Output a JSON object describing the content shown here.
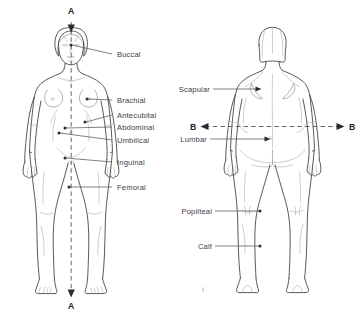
{
  "figure": {
    "background_color": "#ffffff",
    "line_color": "#3c3c42",
    "label_color": "#404048",
    "width": 361,
    "height": 315
  },
  "anterior_view": {
    "name": "anterior-figure",
    "section_axis": {
      "top_letter": "A",
      "bottom_letter": "A",
      "orientation": "vertical",
      "style": "dashed"
    },
    "labels": [
      {
        "id": "buccal",
        "text": "Buccal",
        "text_x": 117,
        "text_y": 57,
        "line_x1": 112,
        "line_y1": 54,
        "line_x2": 72,
        "line_y2": 45,
        "dot_x": 71,
        "dot_y": 45
      },
      {
        "id": "brachial",
        "text": "Brachial",
        "text_x": 117,
        "text_y": 103,
        "line_x1": 112,
        "line_y1": 100,
        "line_x2": 88,
        "line_y2": 99,
        "dot_x": 87,
        "dot_y": 99
      },
      {
        "id": "antecubital",
        "text": "Antecubital",
        "text_x": 117,
        "text_y": 118,
        "line_x1": 112,
        "line_y1": 115,
        "line_x2": 86,
        "line_y2": 122,
        "dot_x": 85,
        "dot_y": 122
      },
      {
        "id": "abdominal",
        "text": "Abdominal",
        "text_x": 117,
        "text_y": 130,
        "line_x1": 112,
        "line_y1": 127,
        "line_x2": 66,
        "line_y2": 128,
        "dot_x": 65,
        "dot_y": 128
      },
      {
        "id": "umbilical",
        "text": "Umbilical",
        "text_x": 117,
        "text_y": 143,
        "line_x1": 112,
        "line_y1": 140,
        "line_x2": 60,
        "line_y2": 133,
        "dot_x": 59,
        "dot_y": 133
      },
      {
        "id": "inguinal",
        "text": "Inguinal",
        "text_x": 117,
        "text_y": 165,
        "line_x1": 112,
        "line_y1": 162,
        "line_x2": 66,
        "line_y2": 158,
        "dot_x": 65,
        "dot_y": 158
      },
      {
        "id": "femoral",
        "text": "Femoral",
        "text_x": 117,
        "text_y": 190,
        "line_x1": 112,
        "line_y1": 187,
        "line_x2": 70,
        "line_y2": 187,
        "dot_x": 69,
        "dot_y": 187
      }
    ]
  },
  "posterior_view": {
    "name": "posterior-figure",
    "section_axis": {
      "left_letter": "B",
      "right_letter": "B",
      "orientation": "horizontal",
      "style": "dashed"
    },
    "labels": [
      {
        "id": "scapular",
        "text": "Scapular",
        "text_x": 181,
        "text_y": 92,
        "line_x1": 213,
        "line_y1": 89,
        "line_x2": 259,
        "line_y2": 89,
        "dot_x": 260,
        "dot_y": 89
      },
      {
        "id": "lumbar",
        "text": "Lumbar",
        "text_x": 181,
        "text_y": 142,
        "line_x1": 210,
        "line_y1": 139,
        "line_x2": 268,
        "line_y2": 139,
        "dot_x": 269,
        "dot_y": 139
      },
      {
        "id": "popliteal",
        "text": "Popliteal",
        "text_x": 181,
        "text_y": 214,
        "line_x1": 215,
        "line_y1": 211,
        "line_x2": 259,
        "line_y2": 211,
        "dot_x": 260,
        "dot_y": 211
      },
      {
        "id": "calf",
        "text": "Calf",
        "text_x": 198,
        "text_y": 249,
        "line_x1": 215,
        "line_y1": 246,
        "line_x2": 259,
        "line_y2": 246,
        "dot_x": 260,
        "dot_y": 246
      }
    ]
  }
}
